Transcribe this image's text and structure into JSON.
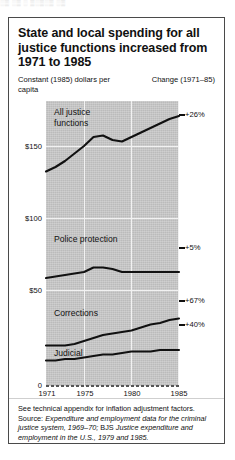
{
  "top_artifact": "░▒ ░▒ ░ ▒░▒░▒ ░▒",
  "title": "State and local spending for all justice functions increased from 1971 to 1985",
  "subtitle": "Constant (1985) dollars per capita",
  "change_header": "Change (1971–85)",
  "axis": {
    "y_ticks": [
      "$150",
      "$100",
      "$50",
      "0"
    ],
    "x_ticks": [
      "1971",
      "1975",
      "1980",
      "1985"
    ]
  },
  "series_labels": {
    "all_justice": "All justice functions",
    "police": "Police protection",
    "corrections": "Corrections",
    "judicial": "Judicial"
  },
  "changes": {
    "all_justice": "+26%",
    "police": "+5%",
    "corrections": "+67%",
    "judicial": "+40%"
  },
  "footnote": {
    "lead": "See technical appendix for inflation adjustment factors. Source: ",
    "source1": "Expenditure and employment data for the criminal justice system, 1969–70;",
    "mid": " BJS ",
    "source2": "Justice expenditure and employment in the U.S., 1979 and 1985.",
    "tail": ""
  },
  "colors": {
    "plot_background": "#c9c9c9",
    "line": "#111111",
    "gridline": "#f2f2f2",
    "border": "#4a4a4a",
    "page": "#ffffff"
  },
  "chart_data": {
    "type": "line",
    "title": "State and local spending for all justice functions increased from 1971 to 1985",
    "subtitle": "Constant (1985) dollars per capita",
    "xlabel": "",
    "ylabel": "Constant (1985) dollars per capita",
    "xlim": [
      1971,
      1985
    ],
    "ylim": [
      0,
      190
    ],
    "y_ticks": [
      0,
      50,
      100,
      150
    ],
    "x_ticks": [
      1971,
      1975,
      1980,
      1985
    ],
    "grid": true,
    "legend": "inline-labels",
    "x": [
      1971,
      1972,
      1973,
      1974,
      1975,
      1976,
      1977,
      1978,
      1979,
      1980,
      1981,
      1982,
      1983,
      1984,
      1985
    ],
    "series": [
      {
        "name": "All justice functions",
        "change_label": "+26%",
        "values": [
          143,
          146,
          150,
          155,
          160,
          166,
          167,
          164,
          163,
          166,
          169,
          172,
          175,
          178,
          180
        ]
      },
      {
        "name": "Police protection",
        "change_label": "+5%",
        "values": [
          72,
          73,
          74,
          75,
          76,
          79,
          79,
          78,
          76,
          76,
          76,
          76,
          76,
          76,
          76
        ]
      },
      {
        "name": "Corrections",
        "change_label": "+67%",
        "values": [
          27,
          27,
          27,
          28,
          30,
          32,
          34,
          35,
          36,
          37,
          39,
          41,
          42,
          44,
          45
        ]
      },
      {
        "name": "Judicial",
        "change_label": "+40%",
        "values": [
          17,
          17,
          18,
          18,
          19,
          20,
          21,
          21,
          22,
          23,
          23,
          23,
          24,
          24,
          24
        ]
      }
    ]
  }
}
